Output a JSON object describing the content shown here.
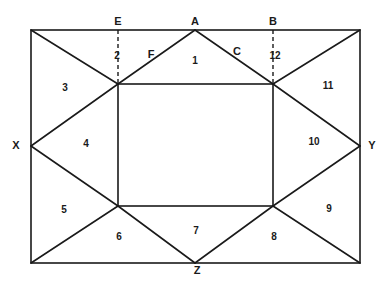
{
  "diagram": {
    "vertex_labels": {
      "E": "E",
      "A": "A",
      "B": "B",
      "X": "X",
      "Y": "Y",
      "Z": "Z",
      "F": "F",
      "C": "C"
    },
    "region_numbers": [
      "1",
      "2",
      "3",
      "4",
      "5",
      "6",
      "7",
      "8",
      "9",
      "10",
      "11",
      "12"
    ],
    "colors": {
      "line": "#1a1a1a",
      "background": "#ffffff"
    }
  }
}
